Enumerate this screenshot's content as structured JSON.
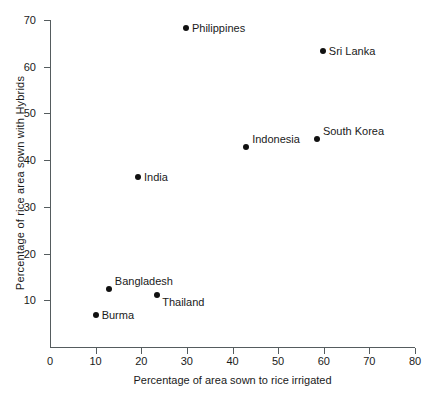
{
  "chart_data": {
    "type": "scatter",
    "title": "",
    "xlabel": "Percentage of area sown to rice irrigated",
    "ylabel": "Percentage of rice area sown with Hybrids",
    "xlim": [
      0,
      80
    ],
    "ylim": [
      0,
      70
    ],
    "xticks": [
      0,
      10,
      20,
      30,
      40,
      50,
      60,
      70,
      80
    ],
    "yticks": [
      10,
      20,
      30,
      40,
      50,
      60,
      70
    ],
    "xtick_labels": [
      "0",
      "10",
      "20",
      "30",
      "40",
      "50",
      "60",
      "70",
      "80"
    ],
    "ytick_labels": [
      "10",
      "20",
      "30",
      "40",
      "50",
      "60",
      "70"
    ],
    "grid": false,
    "legend": "none",
    "marker_color": "#111111",
    "axis_color": "#555c5e",
    "background_color": "#ffffff",
    "points": [
      {
        "label": "Philippines",
        "x": 29.8,
        "y": 68.2,
        "label_pos": "right"
      },
      {
        "label": "Sri Lanka",
        "x": 59.8,
        "y": 63.3,
        "label_pos": "right"
      },
      {
        "label": "South Korea",
        "x": 58.5,
        "y": 44.6,
        "label_pos": "right-up"
      },
      {
        "label": "Indonesia",
        "x": 43.0,
        "y": 42.9,
        "label_pos": "right-up"
      },
      {
        "label": "India",
        "x": 19.3,
        "y": 36.3,
        "label_pos": "right"
      },
      {
        "label": "Bangladesh",
        "x": 12.9,
        "y": 12.4,
        "label_pos": "right-up"
      },
      {
        "label": "Thailand",
        "x": 23.5,
        "y": 11.2,
        "label_pos": "right-down"
      },
      {
        "label": "Burma",
        "x": 10.0,
        "y": 6.9,
        "label_pos": "right"
      }
    ]
  }
}
